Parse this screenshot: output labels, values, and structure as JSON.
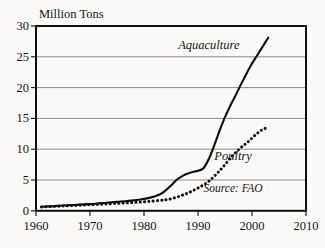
{
  "chart_data": {
    "type": "line",
    "title": "",
    "ylabel": "Million Tons",
    "xlabel": "",
    "xlim": [
      1960,
      2010
    ],
    "ylim": [
      0,
      30
    ],
    "grid": true,
    "legend": "inline-annotations",
    "xticks": [
      "1960",
      "1970",
      "1980",
      "1990",
      "2000",
      "2010"
    ],
    "yticks": [
      "0",
      "5",
      "10",
      "15",
      "20",
      "25",
      "30"
    ],
    "annotations": [
      {
        "name": "aquaculture-label",
        "text": "Aquaculture",
        "x": 1992,
        "y": 26.2
      },
      {
        "name": "poultry-label",
        "text": "Poultry",
        "x": 1996.5,
        "y": 8.2
      },
      {
        "name": "source-note",
        "text": "Source: FAO",
        "x": 1996.5,
        "y": 3.0
      }
    ],
    "x": [
      1961,
      1963,
      1965,
      1967,
      1969,
      1971,
      1973,
      1975,
      1977,
      1979,
      1981,
      1983,
      1984,
      1985,
      1986,
      1987,
      1988,
      1989,
      1990,
      1991,
      1992,
      1993,
      1994,
      1995,
      1996,
      1997,
      1998,
      1999,
      2000,
      2001,
      2002,
      2003
    ],
    "series": [
      {
        "name": "Aquaculture",
        "style": "solid",
        "values": [
          0.65,
          0.75,
          0.85,
          0.95,
          1.05,
          1.15,
          1.3,
          1.45,
          1.6,
          1.8,
          2.1,
          2.7,
          3.3,
          4.1,
          5.0,
          5.6,
          6.0,
          6.3,
          6.5,
          6.9,
          8.4,
          10.6,
          13.0,
          15.2,
          17.1,
          18.8,
          20.6,
          22.3,
          23.9,
          25.3,
          26.7,
          28.1
        ]
      },
      {
        "name": "Poultry",
        "style": "dotted",
        "values": [
          0.62,
          0.7,
          0.78,
          0.86,
          0.95,
          1.02,
          1.12,
          1.2,
          1.3,
          1.4,
          1.52,
          1.7,
          1.8,
          1.95,
          2.2,
          2.5,
          2.85,
          3.25,
          3.7,
          4.2,
          4.8,
          5.6,
          6.5,
          7.5,
          8.6,
          9.5,
          10.3,
          11.0,
          11.8,
          12.6,
          13.2,
          13.6
        ]
      }
    ]
  }
}
